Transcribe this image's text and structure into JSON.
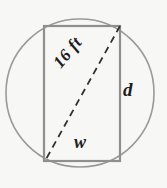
{
  "figure": {
    "background_color": "#f7f7f5",
    "circle": {
      "name": "circle-outline",
      "center_x": 80,
      "center_y": 93,
      "radius": 74,
      "stroke_color": "#9a9a9a",
      "stroke_width": 1.6,
      "fill": "none"
    },
    "rectangle": {
      "name": "inscribed-rectangle",
      "left": 44,
      "top": 26,
      "right": 120,
      "bottom": 161,
      "stroke_color": "#8f8f8f",
      "stroke_width": 2.2,
      "fill": "none"
    },
    "diagonal": {
      "name": "diagonal-dashed-line",
      "x1": 120,
      "y1": 26,
      "x2": 45,
      "y2": 161,
      "stroke_color": "#33312f",
      "stroke_width": 1.8,
      "dash_pattern": "7 5"
    },
    "labels": {
      "diagonal": "16 ft",
      "depth": "d",
      "width": "w"
    }
  }
}
